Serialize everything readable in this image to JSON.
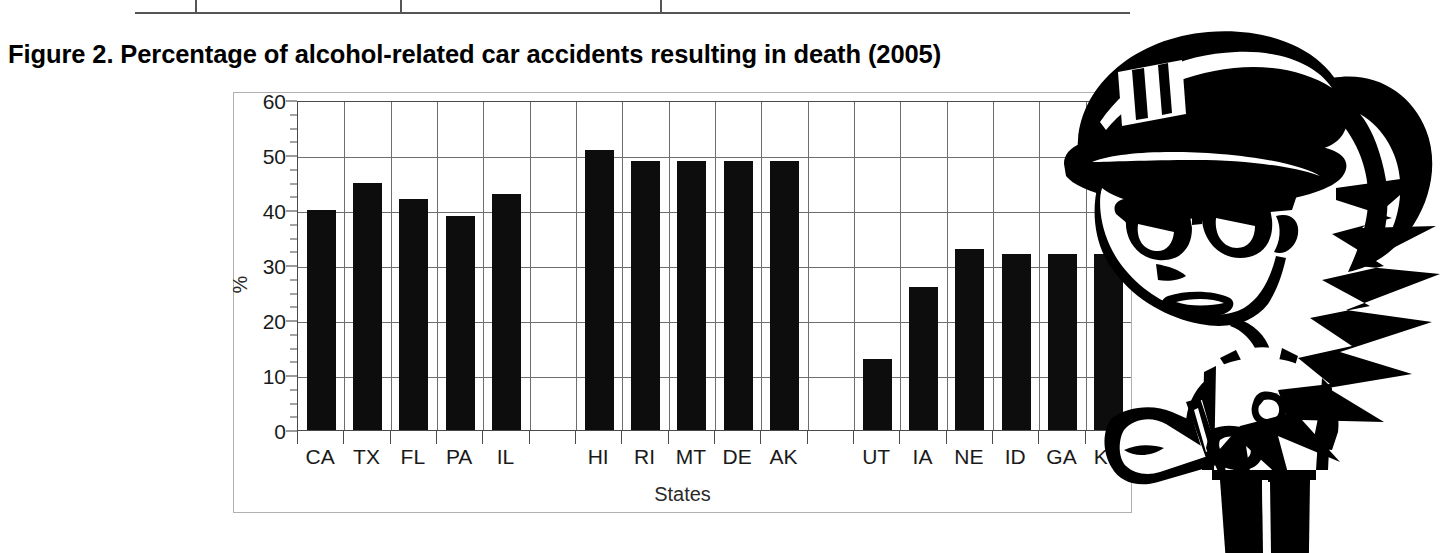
{
  "figure": {
    "title": "Figure 2. Percentage of alcohol-related car accidents resulting in death (2005)"
  },
  "table_remnant": {
    "note": "bottom edge of a table cropped above the figure",
    "divider_x": [
      195,
      400,
      660
    ]
  },
  "chart_data": {
    "type": "bar",
    "title": "Figure 2. Percentage of alcohol-related car accidents resulting in death (2005)",
    "xlabel": "States",
    "ylabel": "%",
    "ylim": [
      0,
      60
    ],
    "ytick_values": [
      0,
      10,
      20,
      30,
      40,
      50,
      60
    ],
    "ytick_labels": [
      "0",
      "10",
      "20",
      "30",
      "40",
      "50",
      "60"
    ],
    "minor_tick_step": 2.5,
    "grid": "horizontal-and-vertical",
    "legend": "none",
    "bar_color": "#0d0d0d",
    "categories": [
      "CA",
      "TX",
      "FL",
      "PA",
      "IL",
      "",
      "HI",
      "RI",
      "MT",
      "DE",
      "AK",
      "",
      "UT",
      "IA",
      "NE",
      "ID",
      "GA",
      "KY"
    ],
    "values": [
      40,
      45,
      42,
      39,
      43,
      null,
      51,
      49,
      49,
      49,
      49,
      null,
      13,
      26,
      33,
      32,
      32,
      32
    ],
    "groups": [
      {
        "name": "group-1",
        "categories": [
          "CA",
          "TX",
          "FL",
          "PA",
          "IL"
        ],
        "values": [
          40,
          45,
          42,
          39,
          43
        ]
      },
      {
        "name": "group-2",
        "categories": [
          "HI",
          "RI",
          "MT",
          "DE",
          "AK"
        ],
        "values": [
          51,
          49,
          49,
          49,
          49
        ]
      },
      {
        "name": "group-3",
        "categories": [
          "UT",
          "IA",
          "NE",
          "ID",
          "GA",
          "KY"
        ],
        "values": [
          13,
          26,
          33,
          32,
          32,
          32
        ]
      }
    ]
  },
  "cartoon": {
    "name": "police-officer-writing-ticket",
    "description": "Cartoon female police officer with peaked cap, sunglasses and ponytail, writing on a ticket pad"
  },
  "colors": {
    "bar": "#0d0d0d",
    "grid": "#6e6e6e",
    "axis": "#3a3a3a",
    "frame": "#b0b0b0",
    "text": "#1a1a1a",
    "background": "#ffffff"
  }
}
